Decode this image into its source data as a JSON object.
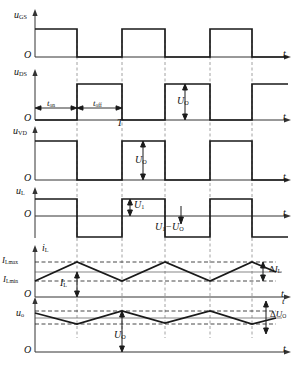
{
  "figure": {
    "type": "timing-waveform-diagram",
    "background": "#ffffff",
    "line_color": "#1a1a1a",
    "axis_color": "#333333",
    "dash_color": "#8a8a8a"
  },
  "axes_origin_label": "O",
  "time_axis_label": "t",
  "period_label": "T",
  "timing": {
    "t_on_label": "t",
    "t_on_sub": "on",
    "t_off_label": "t",
    "t_off_sub": "off"
  },
  "traces": [
    {
      "id": "u-gs",
      "label": "u",
      "label_sub": "GS",
      "kind": "square-in-phase",
      "description": "Gate-source drive voltage, high during t_on"
    },
    {
      "id": "u-ds",
      "label": "u",
      "label_sub": "DS",
      "kind": "square-inverted",
      "description": "Drain-source voltage, high during t_off, amplitude U_O"
    },
    {
      "id": "u-vd",
      "label": "u",
      "label_sub": "VD",
      "kind": "square-in-phase",
      "description": "Diode voltage, high during t_on, amplitude U_O"
    },
    {
      "id": "u-l",
      "label": "u",
      "label_sub": "L",
      "kind": "bipolar-square",
      "description": "Inductor voltage, +U_1 during t_on, -(U_1-U_O) during t_off"
    },
    {
      "id": "i-l",
      "label": "i",
      "label_sub": "L",
      "kind": "triangular-ripple",
      "description": "Inductor current, triangular ripple between I_Lmin and I_Lmax"
    },
    {
      "id": "u-o",
      "label": "u",
      "label_sub": "o",
      "kind": "triangular-ripple",
      "description": "Output voltage with ripple dU_O about mean U_O"
    }
  ],
  "annotations": {
    "uo_1": {
      "main": "U",
      "sub": "O"
    },
    "uo_2": {
      "main": "U",
      "sub": "O"
    },
    "u1": {
      "main": "U",
      "sub": "1"
    },
    "u1_minus_uo": {
      "text": "U",
      "sub1": "1",
      "minus": "−",
      "text2": "U",
      "sub2": "O"
    },
    "i_lmax": {
      "main": "I",
      "sub": "Lmax"
    },
    "i_lmin": {
      "main": "I",
      "sub": "Lmin"
    },
    "i_l_mean": {
      "main": "I",
      "sub": "L"
    },
    "delta_i_l": {
      "delta": "Δ",
      "main": "I",
      "sub": "L"
    },
    "uo_mean": {
      "main": "U",
      "sub": "O"
    },
    "delta_u_o": {
      "delta": "Δ",
      "main": "U",
      "sub": "O"
    }
  }
}
